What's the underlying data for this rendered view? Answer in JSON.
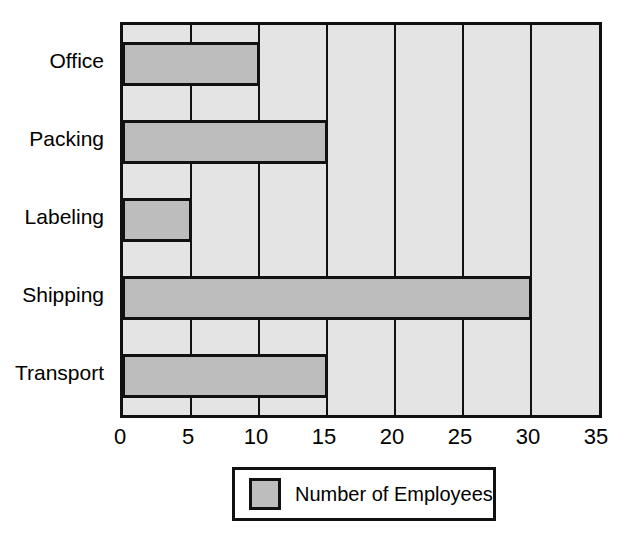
{
  "chart_data": {
    "type": "bar",
    "orientation": "horizontal",
    "title": "",
    "subtitle": "",
    "xlabel": "",
    "ylabel": "",
    "categories": [
      "Office",
      "Packing",
      "Labeling",
      "Shipping",
      "Transport"
    ],
    "values": [
      10,
      15,
      5,
      30,
      15
    ],
    "series": [
      {
        "name": "Number of Employees",
        "values": [
          10,
          15,
          5,
          30,
          15
        ]
      }
    ],
    "xlim": [
      0,
      35
    ],
    "xticks": [
      0,
      5,
      10,
      15,
      20,
      25,
      30,
      35
    ],
    "xtick_labels": [
      "0",
      "5",
      "10",
      "15",
      "20",
      "25",
      "30",
      "35"
    ],
    "grid": true,
    "grid_axis": "x",
    "legend": {
      "position": "bottom",
      "entries": [
        {
          "label": "Number of Employees",
          "color": "#bdbdbd"
        }
      ]
    },
    "colors": {
      "bar_fill": "#bdbdbd",
      "bar_border": "#111111",
      "plot_background": "#e4e4e4",
      "gridline": "#111111",
      "axis": "#111111",
      "text": "#000000",
      "page_background": "#ffffff"
    }
  }
}
